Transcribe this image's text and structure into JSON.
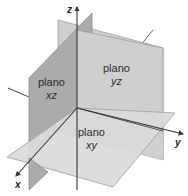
{
  "diagram": {
    "axes": [
      {
        "id": "x",
        "label": "x"
      },
      {
        "id": "y",
        "label": "y"
      },
      {
        "id": "z",
        "label": "z"
      }
    ],
    "planes": [
      {
        "id": "xz",
        "word": "plano",
        "name": "xz",
        "color": "#a9a9a9"
      },
      {
        "id": "yz",
        "word": "plano",
        "name": "yz",
        "color": "#cfcfcf"
      },
      {
        "id": "xy",
        "word": "plano",
        "name": "xy",
        "color": "#d9d9d9"
      }
    ],
    "colors": {
      "axis": "#333333",
      "edge": "#8a8a8a",
      "background": "#ffffff"
    }
  }
}
